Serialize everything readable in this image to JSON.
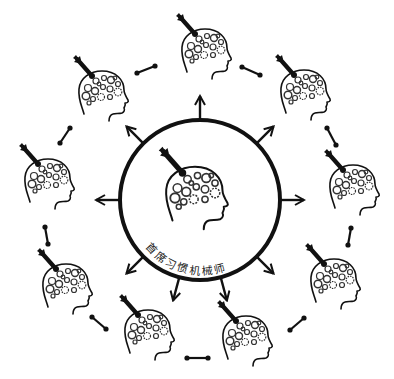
{
  "diagram": {
    "center": {
      "label": "首席习惯机械师",
      "circle": {
        "cx": 200,
        "cy": 200,
        "r": 80
      },
      "head": {
        "x": 160,
        "y": 148,
        "scale": 1.25
      }
    },
    "arrow_directions_deg": [
      270,
      315,
      0,
      45,
      75,
      105,
      135,
      180,
      225
    ],
    "outer_heads": [
      {
        "id": "top",
        "x": 177,
        "y": 14
      },
      {
        "id": "top-right",
        "x": 276,
        "y": 55
      },
      {
        "id": "right",
        "x": 325,
        "y": 150
      },
      {
        "id": "lower-right",
        "x": 306,
        "y": 244
      },
      {
        "id": "bottom-right",
        "x": 218,
        "y": 301
      },
      {
        "id": "bottom-left",
        "x": 120,
        "y": 295
      },
      {
        "id": "lower-left",
        "x": 38,
        "y": 249
      },
      {
        "id": "left",
        "x": 20,
        "y": 144
      },
      {
        "id": "upper-left",
        "x": 74,
        "y": 56
      }
    ],
    "connectors": [
      {
        "id": "top-to-topright",
        "x1": 242,
        "y1": 67,
        "x2": 260,
        "y2": 75
      },
      {
        "id": "topright-to-right",
        "x1": 327,
        "y1": 128,
        "x2": 336,
        "y2": 145
      },
      {
        "id": "right-to-lowerright",
        "x1": 351,
        "y1": 228,
        "x2": 348,
        "y2": 245
      },
      {
        "id": "lowerright-to-bottomright",
        "x1": 290,
        "y1": 330,
        "x2": 304,
        "y2": 318
      },
      {
        "id": "bottomright-to-bottomleft",
        "x1": 187,
        "y1": 358,
        "x2": 208,
        "y2": 358
      },
      {
        "id": "bottomleft-to-lowerleft",
        "x1": 92,
        "y1": 317,
        "x2": 106,
        "y2": 329
      },
      {
        "id": "lowerleft-to-left",
        "x1": 45,
        "y1": 227,
        "x2": 48,
        "y2": 244
      },
      {
        "id": "left-to-upperleft",
        "x1": 70,
        "y1": 128,
        "x2": 60,
        "y2": 143
      },
      {
        "id": "upperleft-to-top",
        "x1": 137,
        "y1": 73,
        "x2": 155,
        "y2": 66
      }
    ],
    "colors": {
      "stroke": "#111111",
      "background": "#ffffff",
      "gear": "#444444"
    }
  }
}
